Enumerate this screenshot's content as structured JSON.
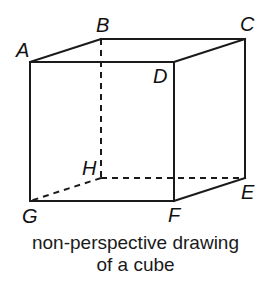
{
  "diagram": {
    "caption_lines": [
      "non-perspective drawing",
      "of a cube"
    ],
    "vertices": {
      "A": {
        "label": "A",
        "x": 30,
        "y": 62
      },
      "B": {
        "label": "B",
        "x": 101,
        "y": 39
      },
      "C": {
        "label": "C",
        "x": 245,
        "y": 39
      },
      "D": {
        "label": "D",
        "x": 174,
        "y": 62
      },
      "E": {
        "label": "E",
        "x": 245,
        "y": 178
      },
      "F": {
        "label": "F",
        "x": 174,
        "y": 201
      },
      "G": {
        "label": "G",
        "x": 30,
        "y": 201
      },
      "H": {
        "label": "H",
        "x": 101,
        "y": 178
      }
    },
    "visible_edges": [
      "A-B",
      "B-C",
      "C-D",
      "D-A",
      "A-G",
      "G-F",
      "F-D",
      "C-E",
      "E-F"
    ],
    "hidden_edges": [
      "B-H",
      "H-G",
      "H-E"
    ],
    "colors": {
      "line": "#1a1a1a",
      "background": "#ffffff"
    }
  }
}
